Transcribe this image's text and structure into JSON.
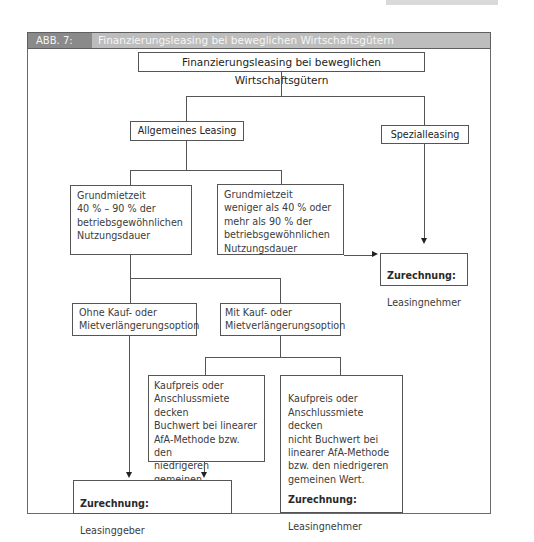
{
  "figure": {
    "label": "ABB. 7:",
    "title": "Finanzierungsleasing bei beweglichen Wirtschaftsgütern"
  },
  "nodes": {
    "root": "Finanzierungsleasing bei beweglichen Wirtschaftsgütern",
    "allgemein": "Allgemeines Leasing",
    "spezial": "Spezialleasing",
    "grund_40_90": "Grundmietzeit\n40 % – 90 % der\nbetriebsgewöhnlichen\nNutzungsdauer",
    "grund_other": "Grundmietzeit\nweniger als 40 % oder\nmehr als 90 % der\nbetriebsgewöhnlichen\nNutzungsdauer",
    "zurechnung_nehmer_1": {
      "heading": "Zurechnung:",
      "value": "Leasingnehmer"
    },
    "ohne_option": "Ohne Kauf- oder\nMietverlängerungsoption",
    "mit_option": "Mit Kauf- oder\nMietverlängerungsoption",
    "decken": "Kaufpreis oder\nAnschlussmiete decken\nBuchwert bei linearer\nAfA-Methode bzw. den\nniedrigeren gemeinen\nWert.",
    "nicht_decken": "Kaufpreis oder\nAnschlussmiete decken\nnicht Buchwert bei\nlinearer AfA-Methode\nbzw. den niedrigeren\ngemeinen Wert.",
    "zurechnung_nehmer_2": {
      "heading": "Zurechnung:",
      "value": "Leasingnehmer"
    },
    "zurechnung_geber": {
      "heading": "Zurechnung:",
      "value": "Leasinggeber"
    }
  }
}
